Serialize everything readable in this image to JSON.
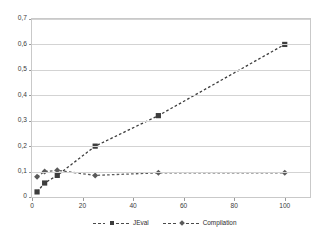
{
  "chart_data": {
    "type": "line",
    "title": "",
    "xlabel": "",
    "ylabel": "",
    "xlim": [
      0,
      110
    ],
    "ylim": [
      0,
      0.7
    ],
    "grid": "horizontal",
    "decimal_separator": ",",
    "legend_position": "bottom-center",
    "x_ticks": [
      "0",
      "20",
      "40",
      "60",
      "80",
      "100"
    ],
    "x_tick_values": [
      0,
      20,
      40,
      60,
      80,
      100
    ],
    "y_ticks": [
      "0",
      "0,1",
      "0,2",
      "0,3",
      "0,4",
      "0,5",
      "0,6",
      "0,7"
    ],
    "y_tick_values": [
      0,
      0.1,
      0.2,
      0.3,
      0.4,
      0.5,
      0.6,
      0.7
    ],
    "series": [
      {
        "name": "JEval",
        "marker": "square",
        "color": "#3d3d3d",
        "linestyle": "dashed",
        "x": [
          2,
          5,
          10,
          25,
          50,
          100
        ],
        "values": [
          0.02,
          0.055,
          0.085,
          0.2,
          0.32,
          0.6
        ]
      },
      {
        "name": "Compilation",
        "marker": "diamond",
        "color": "#5a5a5a",
        "linestyle": "dashed",
        "x": [
          2,
          5,
          10,
          25,
          50,
          100
        ],
        "values": [
          0.08,
          0.1,
          0.105,
          0.085,
          0.095,
          0.095
        ]
      }
    ]
  },
  "legend": {
    "items": [
      {
        "label": "JEval"
      },
      {
        "label": "Compilation"
      }
    ]
  },
  "colors": {
    "grid": "#d3d3d3",
    "frame": "#c9c9c9",
    "text": "#3a3a3a",
    "series_jeval": "#3d3d3d",
    "series_compilation": "#5a5a5a",
    "background": "#ffffff"
  }
}
